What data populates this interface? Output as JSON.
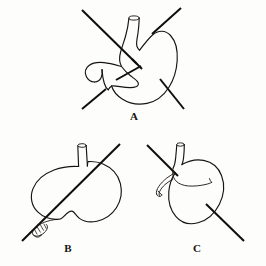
{
  "figure": {
    "background_color": "#fdfdfc",
    "ink_color": "#17140f",
    "panels": [
      {
        "id": "A",
        "label": "A",
        "caption_position": {
          "x": 133,
          "y": 117
        },
        "description": "Anterior view of stomach with esophagus above and duodenum at lower left, crossed by two oblique axis lines",
        "parts": [
          "esophagus",
          "fundus",
          "body",
          "greater-curvature",
          "lesser-curvature",
          "pylorus",
          "duodenum"
        ],
        "axis_lines": [
          {
            "name": "upper-left-to-lower-right-axis",
            "x1": 82,
            "y1": 10,
            "x2": 137,
            "y2": 64
          },
          {
            "name": "upper-right-to-lower-left-axis",
            "x1": 181,
            "y1": 8,
            "x2": 152,
            "y2": 34
          },
          {
            "name": "lower-left-axis",
            "x1": 82,
            "y1": 109,
            "x2": 106,
            "y2": 89
          },
          {
            "name": "lower-right-axis",
            "x1": 160,
            "y1": 79,
            "x2": 184,
            "y2": 109
          }
        ]
      },
      {
        "id": "B",
        "label": "B",
        "caption_position": {
          "x": 67,
          "y": 249
        },
        "description": "Stomach seen from above, rounded form with short esophageal stump at top and duodenal stump at lower left, single oblique axis line",
        "parts": [
          "esophagus",
          "stomach-body",
          "duodenum-stump"
        ],
        "axis_lines": [
          {
            "name": "oblique-axis",
            "x1": 120,
            "y1": 144,
            "x2": 22,
            "y2": 241
          }
        ]
      },
      {
        "id": "C",
        "label": "C",
        "caption_position": {
          "x": 196,
          "y": 249
        },
        "description": "Stomach seen end-on as an oval, esophagus at top, hooked duodenum to the left, single oblique axis line",
        "parts": [
          "esophagus",
          "stomach-oval",
          "duodenum-hook",
          "lesser-curvature-fold"
        ],
        "axis_lines": [
          {
            "name": "oblique-axis",
            "x1": 147,
            "y1": 145,
            "x2": 244,
            "y2": 241
          }
        ]
      }
    ]
  }
}
